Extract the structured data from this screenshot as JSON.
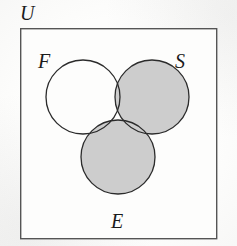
{
  "figure": {
    "kind": "venn-diagram",
    "set_count": 3,
    "width": 237,
    "height": 246
  },
  "labels": {
    "universe": "U",
    "set_f": "F",
    "set_s": "S",
    "set_e": "E"
  },
  "universe_box": {
    "x": 20,
    "y": 28,
    "width": 196,
    "height": 210,
    "stroke": "#555555",
    "stroke_width": 1.4,
    "fill": "#fdfdfc"
  },
  "circles": [
    {
      "name": "F",
      "cx": 83,
      "cy": 97,
      "r": 37,
      "shaded": false,
      "label": "F"
    },
    {
      "name": "S",
      "cx": 152,
      "cy": 97,
      "r": 37,
      "shaded": true,
      "label": "S"
    },
    {
      "name": "E",
      "cx": 118,
      "cy": 157,
      "r": 37,
      "shaded": true,
      "label": "E"
    }
  ],
  "shading": {
    "shaded_region": "S union E",
    "unshaded_region": "F only",
    "fill": "#cdcdcd",
    "stroke": "#2b2b2b",
    "stroke_width": 1.3
  },
  "colors": {
    "background": "#fdfdfc",
    "shade_gray": "#cdcdcd",
    "line_dark": "#2b2b2b",
    "box_border": "#555555",
    "text": "#1b1b1b"
  }
}
